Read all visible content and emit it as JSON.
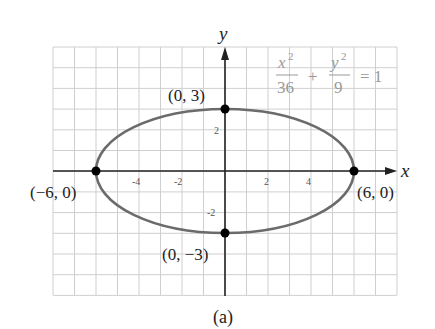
{
  "chart_data": {
    "type": "line",
    "title": "",
    "caption": "(a)",
    "equation": {
      "num1": "x",
      "exp1": "2",
      "den1": "36",
      "plus": "+",
      "num2": "y",
      "exp2": "2",
      "den2": "9",
      "rhs": "= 1"
    },
    "xlabel": "x",
    "ylabel": "y",
    "xlim": [
      -8,
      8
    ],
    "ylim": [
      -6,
      6
    ],
    "grid": true,
    "x_ticks": [
      "-4",
      "-2",
      "2",
      "4"
    ],
    "y_ticks": [
      "2",
      "-2"
    ],
    "curve": {
      "shape": "ellipse",
      "a": 6,
      "b": 3,
      "color": "#6b6b6b"
    },
    "points": [
      {
        "x": 0,
        "y": 3,
        "label": "(0, 3)"
      },
      {
        "x": 0,
        "y": -3,
        "label": "(0, −3)"
      },
      {
        "x": -6,
        "y": 0,
        "label": "(−6, 0)"
      },
      {
        "x": 6,
        "y": 0,
        "label": "(6, 0)"
      }
    ]
  }
}
